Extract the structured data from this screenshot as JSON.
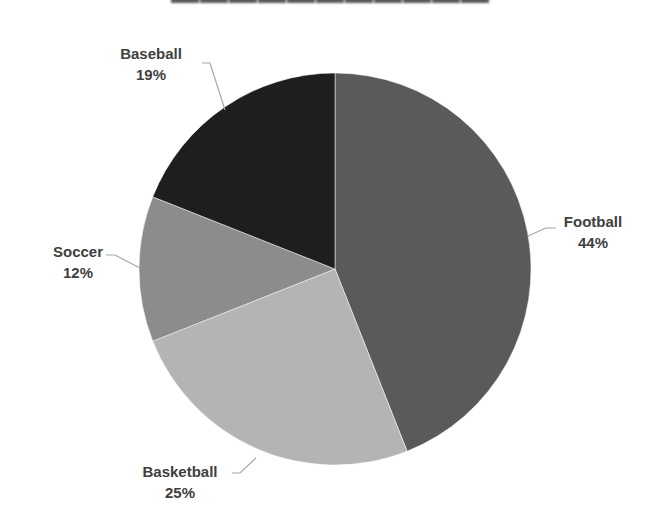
{
  "chart_data": {
    "type": "pie",
    "title": "",
    "title_note": "Title is cropped at the top edge of the image and not legible",
    "categories": [
      "Football",
      "Basketball",
      "Soccer",
      "Baseball"
    ],
    "values": [
      44,
      25,
      12,
      19
    ],
    "unit": "%",
    "colors": [
      "#5a5a5a",
      "#b4b4b4",
      "#8c8c8c",
      "#1e1e1e"
    ],
    "start_angle_deg": 0,
    "direction": "clockwise",
    "data_labels": [
      "Football 44%",
      "Basketball 25%",
      "Soccer 12%",
      "Baseball 19%"
    ],
    "legend": "none"
  },
  "labels": {
    "football": {
      "name": "Football",
      "pct": "44%"
    },
    "basketball": {
      "name": "Basketball",
      "pct": "25%"
    },
    "soccer": {
      "name": "Soccer",
      "pct": "12%"
    },
    "baseball": {
      "name": "Baseball",
      "pct": "19%"
    }
  }
}
